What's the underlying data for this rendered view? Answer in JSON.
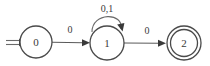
{
  "diagram": {
    "kind": "finite-state-automaton",
    "background_color": "#ffffff",
    "stroke_color": "#4a4a4a",
    "text_color": "#3a3a3a",
    "states": [
      {
        "id": "0",
        "label": "0",
        "cx": 36,
        "cy": 42,
        "r": 16,
        "is_start": true,
        "is_accepting": false
      },
      {
        "id": "1",
        "label": "1",
        "cx": 107,
        "cy": 43,
        "r": 17,
        "is_start": false,
        "is_accepting": false
      },
      {
        "id": "2",
        "label": "2",
        "cx": 184,
        "cy": 43,
        "r": 17,
        "inner_r": 13.5,
        "is_start": false,
        "is_accepting": true
      }
    ],
    "transitions": [
      {
        "from": "0",
        "to": "1",
        "label": "0",
        "label_x": 70,
        "label_y": 33,
        "kind": "straight"
      },
      {
        "from": "1",
        "to": "1",
        "label": "0,1",
        "label_x": 107,
        "label_y": 12,
        "kind": "self-loop"
      },
      {
        "from": "1",
        "to": "2",
        "label": "0",
        "label_x": 147,
        "label_y": 34,
        "kind": "straight"
      }
    ],
    "start_marker": {
      "name": "double-arrow",
      "x1": 6,
      "x2": 20,
      "y": 43
    }
  }
}
